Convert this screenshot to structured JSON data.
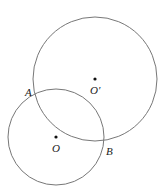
{
  "diagram": {
    "circles": [
      {
        "name": "circle-O-prime",
        "cx": 95,
        "cy": 79,
        "r": 62
      },
      {
        "name": "circle-O",
        "cx": 56,
        "cy": 137,
        "r": 48
      }
    ],
    "points": {
      "A": {
        "label": "A",
        "x": 34,
        "y": 93
      },
      "B": {
        "label": "B",
        "x": 104,
        "y": 143
      },
      "O": {
        "label": "O",
        "x": 56,
        "y": 137
      },
      "O_prime": {
        "label": "O′",
        "x": 95,
        "y": 79
      }
    },
    "stroke_color": "#777777"
  }
}
